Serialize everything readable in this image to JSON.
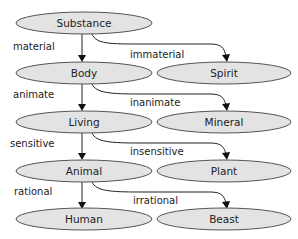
{
  "diagram": {
    "type": "tree-of-porphyry",
    "nodes": [
      {
        "id": "substance",
        "label": "Substance"
      },
      {
        "id": "body",
        "label": "Body"
      },
      {
        "id": "spirit",
        "label": "Spirit"
      },
      {
        "id": "living",
        "label": "Living"
      },
      {
        "id": "mineral",
        "label": "Mineral"
      },
      {
        "id": "animal",
        "label": "Animal"
      },
      {
        "id": "plant",
        "label": "Plant"
      },
      {
        "id": "human",
        "label": "Human"
      },
      {
        "id": "beast",
        "label": "Beast"
      }
    ],
    "edges": [
      {
        "from": "substance",
        "to": "body",
        "label": "material"
      },
      {
        "from": "substance",
        "to": "spirit",
        "label": "immaterial"
      },
      {
        "from": "body",
        "to": "living",
        "label": "animate"
      },
      {
        "from": "body",
        "to": "mineral",
        "label": "inanimate"
      },
      {
        "from": "living",
        "to": "animal",
        "label": "sensitive"
      },
      {
        "from": "living",
        "to": "plant",
        "label": "insensitive"
      },
      {
        "from": "animal",
        "to": "human",
        "label": "rational"
      },
      {
        "from": "animal",
        "to": "beast",
        "label": "irrational"
      }
    ],
    "colors": {
      "node_fill": "#e3e3e3",
      "node_stroke": "#555555",
      "edge": "#222222",
      "text": "#222222"
    }
  }
}
